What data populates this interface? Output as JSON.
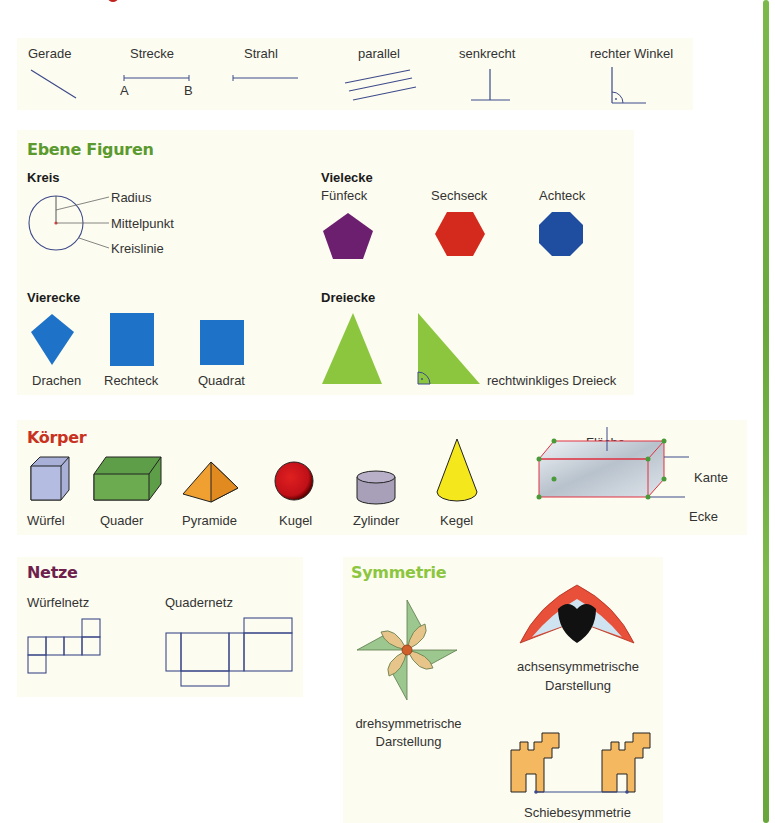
{
  "lines": {
    "items": [
      {
        "label": "Gerade"
      },
      {
        "label": "Strecke",
        "point_a": "A",
        "point_b": "B"
      },
      {
        "label": "Strahl"
      },
      {
        "label": "parallel"
      },
      {
        "label": "senkrecht"
      },
      {
        "label": "rechter Winkel"
      }
    ]
  },
  "ebene_figuren": {
    "title": "Ebene Figuren",
    "title_color": "#5a9a2e",
    "kreis": {
      "heading": "Kreis",
      "labels": [
        "Radius",
        "Mittelpunkt",
        "Kreislinie"
      ]
    },
    "vielecke": {
      "heading": "Vielecke",
      "items": [
        {
          "label": "Fünfeck",
          "color": "#6b1f6e"
        },
        {
          "label": "Sechseck",
          "color": "#d42a1e"
        },
        {
          "label": "Achteck",
          "color": "#1f4da0"
        }
      ]
    },
    "vierecke": {
      "heading": "Vierecke",
      "items": [
        {
          "label": "Drachen"
        },
        {
          "label": "Rechteck"
        },
        {
          "label": "Quadrat"
        }
      ],
      "color": "#1e73c8"
    },
    "dreiecke": {
      "heading": "Dreiecke",
      "right_label": "rechtwinkliges Dreieck",
      "color": "#8cc63f"
    }
  },
  "koerper": {
    "title": "Körper",
    "title_color": "#c8321e",
    "items": [
      {
        "label": "Würfel"
      },
      {
        "label": "Quader"
      },
      {
        "label": "Pyramide"
      },
      {
        "label": "Kugel"
      },
      {
        "label": "Zylinder"
      },
      {
        "label": "Kegel"
      }
    ],
    "diagram": {
      "flaeche": "Fläche",
      "kante": "Kante",
      "ecke": "Ecke"
    }
  },
  "netze": {
    "title": "Netze",
    "title_color": "#6e1f4e",
    "items": [
      {
        "label": "Würfelnetz"
      },
      {
        "label": "Quadernetz"
      }
    ]
  },
  "symmetrie": {
    "title": "Symmetrie",
    "title_color": "#8cc63f",
    "dreh": {
      "line1": "drehsymmetrische",
      "line2": "Darstellung"
    },
    "achsen": {
      "line1": "achsensymmetrische",
      "line2": "Darstellung"
    },
    "schiebe": {
      "label": "Schiebesymmetrie"
    }
  }
}
